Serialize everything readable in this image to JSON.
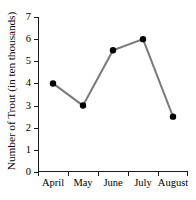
{
  "chart_data": {
    "type": "line",
    "title": "",
    "xlabel": "",
    "ylabel": "Number of Trout (in ten thousands)",
    "categories": [
      "April",
      "May",
      "June",
      "July",
      "August"
    ],
    "values": [
      4,
      3,
      5.5,
      6,
      2.5
    ],
    "series": [
      {
        "name": "Number of Trout",
        "values": [
          4,
          3,
          5.5,
          6,
          2.5
        ]
      }
    ],
    "ylim": [
      0,
      7
    ],
    "y_ticks": [
      0,
      1,
      2,
      3,
      4,
      5,
      6,
      7
    ],
    "y_tick_labels": [
      "0",
      "1",
      "2",
      "3",
      "4",
      "5",
      "6",
      "7"
    ],
    "grid": false,
    "legend": false,
    "legend_position": "none",
    "marker": "filled-circle",
    "line_color": "#7a7a7a",
    "marker_color": "#000000",
    "axis_color": "#1a1a1a",
    "background_color": "#ffffff"
  }
}
